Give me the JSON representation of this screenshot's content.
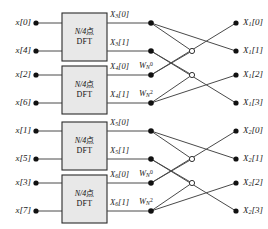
{
  "diagram": {
    "colors": {
      "line": "#4a4a4a",
      "box_fill": "#e8e8e8",
      "box_stroke": "#2b2b2b",
      "node_fill": "#111111",
      "node_open_fill": "#ffffff",
      "text": "#1a1a1a"
    },
    "inputs": [
      {
        "label": "x[0]"
      },
      {
        "label": "x[4]"
      },
      {
        "label": "x[2]"
      },
      {
        "label": "x[6]"
      },
      {
        "label": "x[1]"
      },
      {
        "label": "x[5]"
      },
      {
        "label": "x[3]"
      },
      {
        "label": "x[7]"
      }
    ],
    "dft_blocks": [
      {
        "line1": "N/4",
        "cjk": "点",
        "line2": "DFT"
      },
      {
        "line1": "N/4",
        "cjk": "点",
        "line2": "DFT"
      },
      {
        "line1": "N/4",
        "cjk": "点",
        "line2": "DFT"
      },
      {
        "line1": "N/4",
        "cjk": "点",
        "line2": "DFT"
      }
    ],
    "intermediate": [
      {
        "base": "X",
        "sub": "3",
        "idx": "[0]"
      },
      {
        "base": "X",
        "sub": "3",
        "idx": "[1]"
      },
      {
        "base": "X",
        "sub": "4",
        "idx": "[0]"
      },
      {
        "base": "X",
        "sub": "4",
        "idx": "[1]"
      },
      {
        "base": "X",
        "sub": "5",
        "idx": "[0]"
      },
      {
        "base": "X",
        "sub": "5",
        "idx": "[1]"
      },
      {
        "base": "X",
        "sub": "6",
        "idx": "[0]"
      },
      {
        "base": "X",
        "sub": "6",
        "idx": "[1]"
      }
    ],
    "twiddles": [
      {
        "base": "W",
        "sub": "N",
        "sup": "0"
      },
      {
        "base": "W",
        "sub": "N",
        "sup": "2"
      },
      {
        "base": "W",
        "sub": "N",
        "sup": "0"
      },
      {
        "base": "W",
        "sub": "N",
        "sup": "2"
      }
    ],
    "outputs": [
      {
        "base": "X",
        "sub": "1",
        "idx": "[0]"
      },
      {
        "base": "X",
        "sub": "1",
        "idx": "[1]"
      },
      {
        "base": "X",
        "sub": "1",
        "idx": "[2]"
      },
      {
        "base": "X",
        "sub": "1",
        "idx": "[3]"
      },
      {
        "base": "X",
        "sub": "2",
        "idx": "[0]"
      },
      {
        "base": "X",
        "sub": "2",
        "idx": "[1]"
      },
      {
        "base": "X",
        "sub": "2",
        "idx": "[2]"
      },
      {
        "base": "X",
        "sub": "2",
        "idx": "[3]"
      }
    ]
  }
}
